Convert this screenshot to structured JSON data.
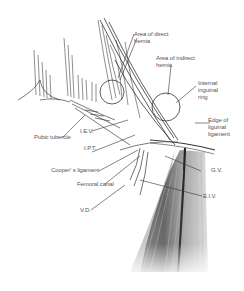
{
  "diagram": {
    "colors": {
      "ink": "#3a3a3a",
      "label": "#555555",
      "shade_dark": "#4a4a4a",
      "shade_light": "#d8d8d8",
      "background": "#ffffff"
    },
    "labels": {
      "direct_hernia": "Area of direct\nhernia",
      "indirect_hernia": "Area of indirect\nhernia",
      "internal_ring": "Internal\ninguinal\nring",
      "edge_ligament": "Edge of\nliguinal\nligament",
      "pubic_tubercle": "Pubic tubercle",
      "iev": "I.E.V.",
      "ipt": "I.P.T.",
      "coopers": "Cooper' s ligament",
      "femoral_canal": "Femoral canal",
      "vd": "V.D.",
      "gv": "G.V.",
      "eiv": "E.I.V."
    }
  }
}
